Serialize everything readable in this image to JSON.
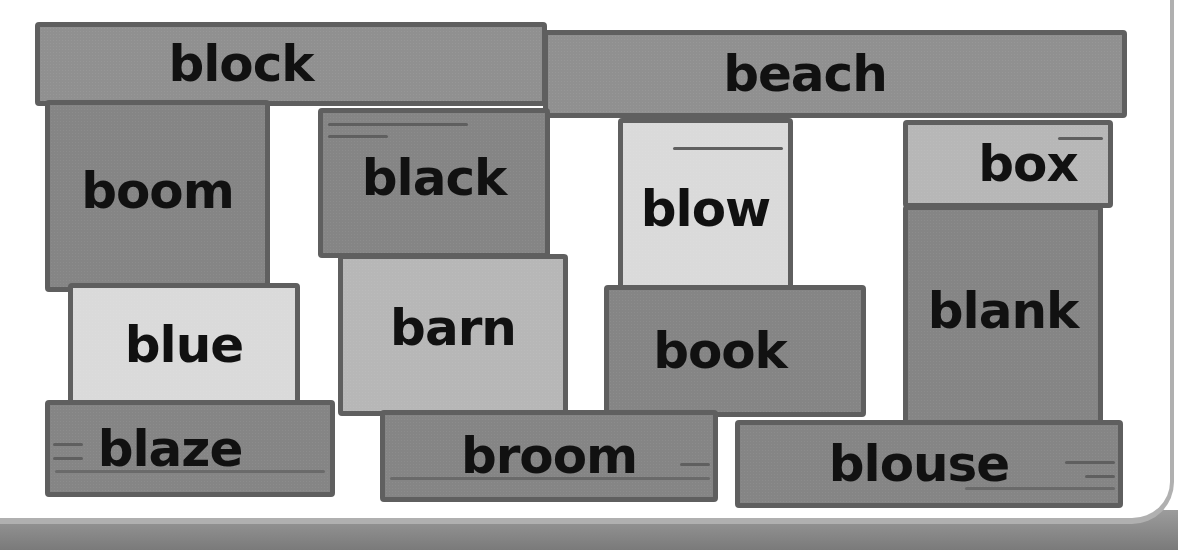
{
  "bricks": [
    {
      "word": "block",
      "shade": "mid"
    },
    {
      "word": "beach",
      "shade": "mid"
    },
    {
      "word": "boom",
      "shade": "dark"
    },
    {
      "word": "black",
      "shade": "dark"
    },
    {
      "word": "blow",
      "shade": "light"
    },
    {
      "word": "box",
      "shade": "pale"
    },
    {
      "word": "blue",
      "shade": "light"
    },
    {
      "word": "barn",
      "shade": "pale"
    },
    {
      "word": "book",
      "shade": "dark"
    },
    {
      "word": "blank",
      "shade": "dark"
    },
    {
      "word": "blaze",
      "shade": "dark"
    },
    {
      "word": "broom",
      "shade": "dark"
    },
    {
      "word": "blouse",
      "shade": "dark"
    }
  ],
  "colors": {
    "outline": "#5f5f5f",
    "mid": "#909090",
    "dark": "#858585",
    "light": "#dadada",
    "pale": "#b7b7b7",
    "text": "#111111"
  }
}
